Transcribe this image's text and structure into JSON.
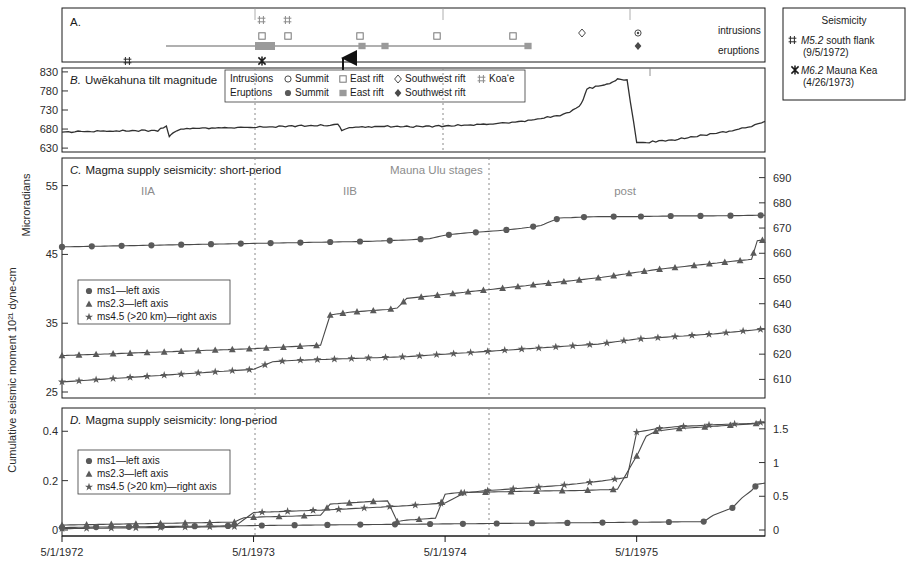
{
  "figure": {
    "ylabel_main": "Cumulative seismic moment 10²¹ dyne-cm",
    "xaxis": {
      "ticks": [
        "5/1/1972",
        "5/1/1973",
        "5/1/1974",
        "5/1/1975"
      ],
      "tick_positions": [
        0,
        1,
        2,
        3
      ],
      "range_start": "5/1/1972",
      "range_end": "1/1/1976"
    },
    "stage_dividers": [
      "5/1/1973",
      "5/1/1974"
    ]
  },
  "panel_a": {
    "label": "A.",
    "row_labels": [
      "intrusions",
      "eruptions"
    ],
    "legend": {
      "intrusions_label": "Intrusions",
      "eruptions_label": "Eruptions",
      "intrusion_items": [
        {
          "symbol": "open-circle",
          "label": "Summit"
        },
        {
          "symbol": "open-square",
          "label": "East rift"
        },
        {
          "symbol": "open-diamond",
          "label": "Southwest rift"
        },
        {
          "symbol": "double-cross",
          "label": "Koa‘e"
        }
      ],
      "eruption_items": [
        {
          "symbol": "filled-circle",
          "label": "Summit"
        },
        {
          "symbol": "filled-square",
          "label": "East rift"
        },
        {
          "symbol": "filled-diamond",
          "label": "Southwest rift"
        }
      ]
    },
    "events": {
      "koae_intrusions_x": [
        0.545,
        0.625
      ],
      "east_rift_intrusions_x": [
        0.545,
        0.625,
        1.44,
        1.9,
        2.33
      ],
      "summit_intrusions_x": [
        3.13
      ],
      "southwest_rift_intrusions_x": [
        2.86
      ],
      "east_rift_eruptions_x": [
        0.565,
        1.46,
        1.6,
        2.44
      ],
      "southwest_rift_eruptions_x": [
        3.13
      ],
      "eruption_span": {
        "start_x": 0.545,
        "end_x": 2.47
      }
    }
  },
  "panel_b": {
    "label": "B.",
    "title": "Uwēkahuna tilt magnitude",
    "ylabel": "Microradians",
    "yticks": [
      630,
      680,
      730,
      780,
      830
    ],
    "ylim": [
      625,
      835
    ]
  },
  "panel_c": {
    "label": "C.",
    "title": "Magma supply seismicity: short-period",
    "stages_header": "Mauna Ulu stages",
    "stages": [
      "IIA",
      "IIB",
      "post"
    ],
    "left_yticks": [
      25,
      35,
      45,
      55
    ],
    "left_ylim": [
      25,
      58
    ],
    "right_yticks": [
      610,
      620,
      630,
      640,
      650,
      660,
      670,
      680,
      690
    ],
    "right_ylim": [
      605,
      695
    ],
    "legend": [
      {
        "symbol": "filled-circle",
        "label": "ms1—left axis"
      },
      {
        "symbol": "filled-triangle",
        "label": "ms2.3—left axis"
      },
      {
        "symbol": "star",
        "label": "ms4.5 (>20 km)—right axis"
      }
    ]
  },
  "panel_d": {
    "label": "D.",
    "title": "Magma supply seismicity: long-period",
    "left_yticks": [
      0,
      0.2,
      0.4
    ],
    "left_ylim": [
      0,
      0.47
    ],
    "right_yticks": [
      0,
      0.5,
      1,
      1.5
    ],
    "right_ylim": [
      0,
      1.72
    ],
    "legend": [
      {
        "symbol": "filled-circle",
        "label": "ms1—left axis"
      },
      {
        "symbol": "filled-triangle",
        "label": "ms2.3—left axis"
      },
      {
        "symbol": "star",
        "label": "ms4.5 (>20 km)—right axis"
      }
    ]
  },
  "seismicity_legend": {
    "title": "Seismicity",
    "items": [
      {
        "symbol": "double-cross",
        "magnitude": "M5.2",
        "place": "south flank",
        "date": "(9/5/1972)"
      },
      {
        "symbol": "star-x",
        "magnitude": "M6.2",
        "place": "Mauna Kea",
        "date": "(4/26/1973)"
      }
    ],
    "marker_m52_x": 0.195,
    "marker_m62_x": 0.545
  },
  "chart_data": {
    "type": "line",
    "xlabel": "",
    "ylabel": "Cumulative seismic moment 10²¹ dyne-cm",
    "x_axis_type": "date",
    "x_ticks": [
      "5/1/1972",
      "5/1/1973",
      "5/1/1974",
      "5/1/1975"
    ],
    "panels": [
      {
        "id": "B",
        "name": "Uwēkahuna tilt magnitude",
        "ylabel": "Microradians",
        "ylim": [
          625,
          835
        ],
        "yticks": [
          630,
          680,
          730,
          780,
          830
        ],
        "series": [
          {
            "name": "Uwekahuna tilt",
            "x": [
              0.0,
              0.1,
              0.2,
              0.3,
              0.4,
              0.5,
              0.545,
              0.56,
              0.58,
              0.62,
              0.7,
              0.8,
              0.9,
              1.0,
              1.1,
              1.2,
              1.3,
              1.4,
              1.44,
              1.46,
              1.5,
              1.6,
              1.7,
              1.8,
              1.9,
              2.0,
              2.1,
              2.2,
              2.3,
              2.4,
              2.45,
              2.5,
              2.55,
              2.6,
              2.65,
              2.7,
              2.72,
              2.74,
              2.8,
              2.86,
              2.88,
              2.9,
              2.95,
              3.0,
              3.05,
              3.1,
              3.2,
              3.3,
              3.4,
              3.5,
              3.6,
              3.67
            ],
            "y": [
              672,
              673,
              674,
              675,
              676,
              676,
              688,
              660,
              672,
              681,
              682,
              683,
              684,
              685,
              686,
              688,
              689,
              690,
              692,
              676,
              684,
              686,
              687,
              686,
              687,
              688,
              690,
              692,
              695,
              700,
              704,
              708,
              712,
              716,
              724,
              740,
              756,
              786,
              792,
              800,
              806,
              812,
              808,
              646,
              644,
              648,
              652,
              660,
              668,
              676,
              688,
              700
            ]
          }
        ]
      },
      {
        "id": "C",
        "name": "Magma supply seismicity: short-period",
        "left_ylim": [
          25,
          58
        ],
        "right_ylim": [
          605,
          695
        ],
        "series": [
          {
            "name": "ms1—left axis",
            "axis": "left",
            "marker": "filled-circle",
            "x": [
              0.0,
              0.2,
              0.4,
              0.6,
              0.8,
              1.0,
              1.2,
              1.4,
              1.6,
              1.8,
              1.92,
              2.0,
              2.1,
              2.2,
              2.3,
              2.4,
              2.5,
              2.55,
              2.6,
              2.7,
              2.8,
              2.9,
              3.0,
              3.2,
              3.4,
              3.67
            ],
            "y": [
              46.1,
              46.2,
              46.3,
              46.4,
              46.5,
              46.6,
              46.7,
              46.8,
              46.9,
              47.1,
              47.3,
              47.8,
              48.1,
              48.3,
              48.5,
              48.8,
              49.2,
              49.8,
              50.3,
              50.4,
              50.5,
              50.5,
              50.5,
              50.6,
              50.6,
              50.7
            ]
          },
          {
            "name": "ms2.3—left axis",
            "axis": "left",
            "marker": "filled-triangle",
            "x": [
              0.0,
              0.2,
              0.4,
              0.6,
              0.8,
              1.0,
              1.2,
              1.35,
              1.4,
              1.45,
              1.5,
              1.6,
              1.7,
              1.75,
              1.8,
              1.9,
              2.0,
              2.1,
              2.2,
              2.3,
              2.4,
              2.5,
              2.6,
              2.7,
              2.8,
              2.9,
              3.0,
              3.1,
              3.2,
              3.3,
              3.4,
              3.5,
              3.6,
              3.63,
              3.67
            ],
            "y": [
              30.3,
              30.5,
              30.7,
              30.9,
              31.1,
              31.3,
              31.6,
              31.8,
              36.2,
              36.4,
              36.6,
              36.8,
              37.0,
              37.2,
              38.6,
              38.9,
              39.2,
              39.5,
              39.8,
              40.1,
              40.4,
              40.7,
              41.0,
              41.3,
              41.6,
              42.0,
              42.4,
              42.8,
              43.1,
              43.4,
              43.7,
              44.0,
              44.3,
              47.0,
              47.1
            ]
          },
          {
            "name": "ms4.5 (>20 km)—right axis",
            "axis": "right",
            "marker": "star",
            "x": [
              0.0,
              0.2,
              0.4,
              0.6,
              0.8,
              1.0,
              1.1,
              1.2,
              1.4,
              1.6,
              1.8,
              2.0,
              2.2,
              2.4,
              2.6,
              2.8,
              3.0,
              3.2,
              3.4,
              3.6,
              3.67
            ],
            "y": [
              609,
              610,
              611,
              612,
              613,
              614,
              617,
              617.5,
              618,
              618.5,
              619,
              620,
              621,
              622,
              623,
              624,
              626,
              627,
              628,
              629.5,
              630
            ]
          }
        ]
      },
      {
        "id": "D",
        "name": "Magma supply seismicity: long-period",
        "left_ylim": [
          0,
          0.47
        ],
        "right_ylim": [
          0,
          1.72
        ],
        "series": [
          {
            "name": "ms1—left axis",
            "axis": "left",
            "marker": "filled-circle",
            "x": [
              0.0,
              0.2,
              0.5,
              0.8,
              1.0,
              1.3,
              1.6,
              1.9,
              2.2,
              2.5,
              2.8,
              3.1,
              3.35,
              3.4,
              3.5,
              3.55,
              3.6,
              3.63,
              3.67
            ],
            "y": [
              0.01,
              0.012,
              0.014,
              0.016,
              0.018,
              0.02,
              0.022,
              0.024,
              0.026,
              0.028,
              0.03,
              0.032,
              0.034,
              0.06,
              0.09,
              0.13,
              0.16,
              0.185,
              0.19
            ]
          },
          {
            "name": "ms2.3—left axis",
            "axis": "left",
            "marker": "filled-triangle",
            "x": [
              0.0,
              0.3,
              0.6,
              0.9,
              0.95,
              1.0,
              1.2,
              1.35,
              1.4,
              1.5,
              1.6,
              1.7,
              1.75,
              1.8,
              1.95,
              2.0,
              2.05,
              2.1,
              2.3,
              2.5,
              2.7,
              2.9,
              3.0,
              3.05,
              3.1,
              3.2,
              3.4,
              3.6,
              3.67
            ],
            "y": [
              0.02,
              0.024,
              0.028,
              0.032,
              0.05,
              0.052,
              0.056,
              0.06,
              0.105,
              0.11,
              0.115,
              0.118,
              0.035,
              0.04,
              0.048,
              0.145,
              0.15,
              0.152,
              0.155,
              0.158,
              0.16,
              0.165,
              0.3,
              0.38,
              0.4,
              0.41,
              0.42,
              0.43,
              0.435
            ]
          },
          {
            "name": "ms4.5 (>20 km)—right axis",
            "axis": "right",
            "marker": "star",
            "x": [
              0.0,
              0.3,
              0.6,
              0.9,
              1.0,
              1.2,
              1.4,
              1.6,
              1.8,
              2.0,
              2.1,
              2.2,
              2.4,
              2.6,
              2.8,
              2.95,
              3.0,
              3.1,
              3.2,
              3.4,
              3.6,
              3.67
            ],
            "y": [
              0.02,
              0.03,
              0.04,
              0.05,
              0.26,
              0.28,
              0.3,
              0.33,
              0.36,
              0.4,
              0.55,
              0.58,
              0.62,
              0.66,
              0.72,
              0.78,
              1.45,
              1.5,
              1.53,
              1.56,
              1.58,
              1.6
            ]
          }
        ]
      }
    ]
  }
}
